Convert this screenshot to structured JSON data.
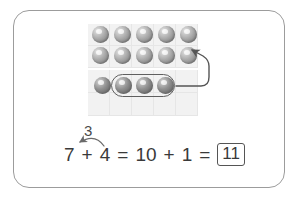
{
  "worksheet": {
    "title": "make-ten-addition-strategy",
    "card_border_color": "#9c9c9c",
    "background_color": "#ffffff"
  },
  "ten_frames": [
    {
      "name": "top-ten-frame",
      "capacity": 10,
      "filled": 10,
      "rows": 2,
      "columns": 5,
      "fill_color": "#a9a9a9",
      "frame_color": "#f2f2f2"
    },
    {
      "name": "bottom-ten-frame",
      "capacity": 10,
      "filled": 4,
      "rows": 2,
      "columns": 5,
      "fill_color": "#8f8f8f",
      "frame_color": "#f2f2f2"
    }
  ],
  "counters": {
    "top_frame_row1": 5,
    "top_frame_row2": 5,
    "bottom_frame_row1": 4,
    "grouped_count": 3,
    "ungrouped_count": 1
  },
  "group_outline": {
    "name": "moved-counters-group",
    "count": 3,
    "stroke_color": "#5f5f5f"
  },
  "arrows": [
    {
      "name": "move-counters-arrow",
      "from": "grouped-counters",
      "to": "top-ten-frame-last-cell",
      "stroke_color": "#555555"
    },
    {
      "name": "decompose-arrow",
      "from": "addend-4",
      "to": "addend-7",
      "label": "3",
      "stroke_color": "#6a6a6a"
    }
  ],
  "equation": {
    "label": "make-ten-equation",
    "tokens": [
      "7",
      "+",
      "4",
      "=",
      "10",
      "+",
      "1",
      "="
    ],
    "answer": "11",
    "bridge_label": "3",
    "text_color": "#3a3a3a"
  }
}
